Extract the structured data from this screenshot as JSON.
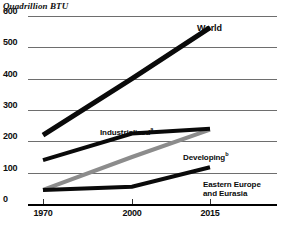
{
  "chart_data": {
    "type": "line",
    "title": "",
    "ylabel": "Quadrillion BTU",
    "xlabel": "",
    "x": [
      1970,
      2000,
      2015
    ],
    "xtick_labels": [
      "1970",
      "2000",
      "2015"
    ],
    "ytick_labels": [
      "0",
      "100",
      "200",
      "300",
      "400",
      "500",
      "600"
    ],
    "yticks": [
      0,
      100,
      200,
      300,
      400,
      500,
      600
    ],
    "ylim": [
      0,
      600
    ],
    "grid": true,
    "legend": "inline-annotations",
    "series": [
      {
        "name": "World",
        "label": "World",
        "footnote": "",
        "color": "#0a0a0a",
        "width": 5,
        "values": [
          220,
          400,
          563
        ]
      },
      {
        "name": "Industrialized",
        "label": "Industrialized",
        "footnote": "a",
        "color": "#0a0a0a",
        "width": 4,
        "values": [
          140,
          225,
          240
        ]
      },
      {
        "name": "Developing",
        "label": "Developing",
        "footnote": "b",
        "color": "#8c8c8c",
        "width": 4,
        "values": [
          45,
          150,
          237
        ]
      },
      {
        "name": "Eastern Europe and Eurasia",
        "label": "Eastern Europe",
        "label_line2": "and Eurasia",
        "footnote": "",
        "color": "#0a0a0a",
        "width": 4,
        "values": [
          45,
          55,
          117
        ]
      }
    ]
  },
  "axis": {
    "unit_caption": "Quadrillion BTU",
    "y_labels": [
      "600",
      "500",
      "400",
      "300",
      "200",
      "100",
      "0"
    ],
    "x_labels": [
      "1970",
      "2000",
      "2015"
    ]
  },
  "annotations": {
    "world": "World",
    "industrialized": "Industrialized",
    "industrialized_note": "a",
    "developing": "Developing",
    "developing_note": "b",
    "eastern_line1": "Eastern Europe",
    "eastern_line2": "and Eurasia"
  },
  "colors": {
    "gridline": "#6e6e6e",
    "axis": "#000000",
    "series_black": "#0a0a0a",
    "series_gray": "#8c8c8c",
    "background": "#ffffff"
  }
}
